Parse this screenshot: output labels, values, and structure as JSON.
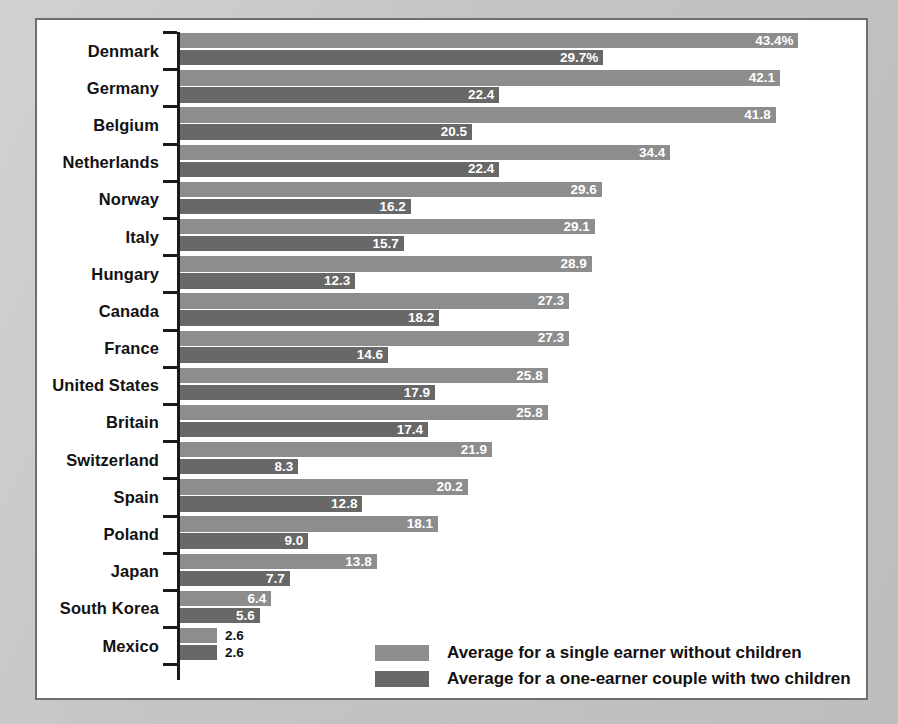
{
  "chart_data": {
    "type": "bar",
    "orientation": "horizontal",
    "title": "",
    "xlabel": "",
    "ylabel": "",
    "xlim": [
      0,
      45
    ],
    "grid": false,
    "legend_position": "bottom-right",
    "value_suffix_first_row": "%",
    "categories": [
      "Denmark",
      "Germany",
      "Belgium",
      "Netherlands",
      "Norway",
      "Italy",
      "Hungary",
      "Canada",
      "France",
      "United States",
      "Britain",
      "Switzerland",
      "Spain",
      "Poland",
      "Japan",
      "South Korea",
      "Mexico"
    ],
    "series": [
      {
        "name": "Average for a single earner without children",
        "color": "#8d8d8d",
        "values": [
          43.4,
          42.1,
          41.8,
          34.4,
          29.6,
          29.1,
          28.9,
          27.3,
          27.3,
          25.8,
          25.8,
          21.9,
          20.2,
          18.1,
          13.8,
          6.4,
          2.6
        ],
        "labels": [
          "43.4%",
          "42.1",
          "41.8",
          "34.4",
          "29.6",
          "29.1",
          "28.9",
          "27.3",
          "27.3",
          "25.8",
          "25.8",
          "21.9",
          "20.2",
          "18.1",
          "13.8",
          "6.4",
          "2.6"
        ]
      },
      {
        "name": "Average for a one-earner couple with two children",
        "color": "#686868",
        "values": [
          29.7,
          22.4,
          20.5,
          22.4,
          16.2,
          15.7,
          12.3,
          18.2,
          14.6,
          17.9,
          17.4,
          8.3,
          12.8,
          9.0,
          7.7,
          5.6,
          2.6
        ],
        "labels": [
          "29.7%",
          "22.4",
          "20.5",
          "22.4",
          "16.2",
          "15.7",
          "12.3",
          "18.2",
          "14.6",
          "17.9",
          "17.4",
          "8.3",
          "12.8",
          "9.0",
          "7.7",
          "5.6",
          "2.6"
        ]
      }
    ]
  },
  "legend": {
    "items": [
      {
        "label": "Average for a single earner without children",
        "color": "#8d8d8d"
      },
      {
        "label": "Average for a one-earner couple with two children",
        "color": "#686868"
      }
    ]
  },
  "style": {
    "panel_background": "#ffffff",
    "page_background": "#c9c9c9",
    "border_color": "#6e6e6e",
    "axis_color": "#1a1a1a",
    "label_color": "#121212",
    "value_label_inside_color": "#ffffff",
    "value_label_outside_color": "#111111"
  }
}
